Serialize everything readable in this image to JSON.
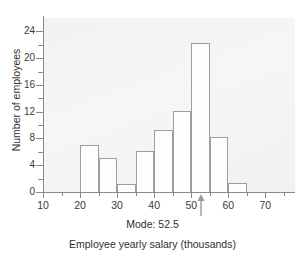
{
  "chart_data": {
    "type": "bar",
    "title": "",
    "subtitle": "",
    "xlabel": "Employee yearly salary (thousands)",
    "ylabel": "Number of employees",
    "xlim": [
      10,
      78
    ],
    "ylim": [
      0,
      26
    ],
    "grid": false,
    "legend": null,
    "bin_width": 5,
    "x_ticks": [
      10,
      20,
      30,
      40,
      50,
      60,
      70
    ],
    "x_tick_labels": [
      "10",
      "20",
      "30",
      "40",
      "50",
      "60",
      "70"
    ],
    "y_ticks": [
      0,
      4,
      8,
      12,
      16,
      20,
      24
    ],
    "y_tick_labels": [
      "0",
      "4",
      "8",
      "12",
      "16",
      "20",
      "24"
    ],
    "y_minor_ticks": [
      2,
      6,
      10,
      14,
      18,
      22
    ],
    "bins": [
      {
        "start": 20,
        "end": 25,
        "value": 7.0
      },
      {
        "start": 25,
        "end": 30,
        "value": 5.1
      },
      {
        "start": 30,
        "end": 35,
        "value": 1.2
      },
      {
        "start": 35,
        "end": 40,
        "value": 6.1
      },
      {
        "start": 40,
        "end": 45,
        "value": 9.3
      },
      {
        "start": 45,
        "end": 50,
        "value": 12.1
      },
      {
        "start": 50,
        "end": 55,
        "value": 22.2
      },
      {
        "start": 55,
        "end": 60,
        "value": 8.2
      },
      {
        "start": 60,
        "end": 65,
        "value": 1.3
      }
    ],
    "categories": [
      "20-25",
      "25-30",
      "30-35",
      "35-40",
      "40-45",
      "45-50",
      "50-55",
      "55-60",
      "60-65"
    ],
    "values": [
      7.0,
      5.1,
      1.2,
      6.1,
      9.3,
      12.1,
      22.2,
      8.2,
      1.3
    ],
    "annotations": [
      {
        "name": "mode-marker",
        "label": "Mode: 52.5",
        "x": 52.5,
        "y": 0,
        "arrow": "up"
      }
    ],
    "colors": {
      "bar_fill": "#fdfdfd",
      "bar_edge": "#9d9d9d",
      "axis": "#8a8a8a",
      "text": "#2f2f2f",
      "plot_background": "#f3f3f3",
      "figure_background": "#ffffff"
    }
  }
}
